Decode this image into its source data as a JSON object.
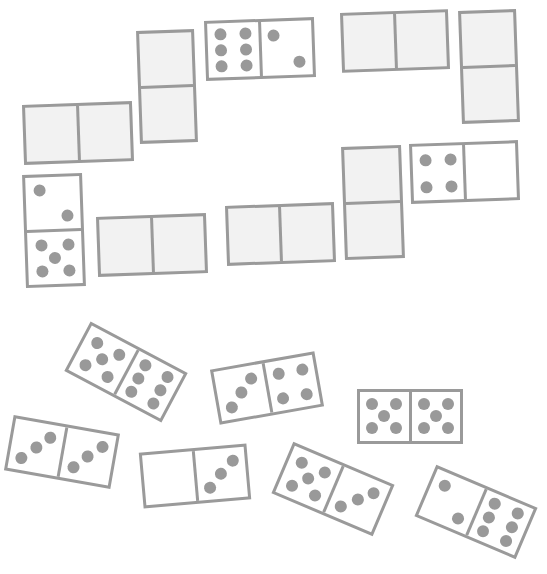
{
  "game": {
    "title": "Dominoes",
    "colors": {
      "background": "#ffffff",
      "border": "#9a9a9a",
      "placed_fill": "#f2f2f2",
      "tile_fill": "#ffffff",
      "pip": "#999999"
    }
  },
  "board": {
    "placed": [
      {
        "id": "p1",
        "orient": "h",
        "x": 23,
        "y": 103,
        "w": 110,
        "h": 60,
        "rot": -2,
        "blank": true,
        "a": null,
        "b": null
      },
      {
        "id": "p2",
        "orient": "v",
        "x": 138,
        "y": 30,
        "w": 58,
        "h": 113,
        "rot": -2,
        "blank": true,
        "a": null,
        "b": null
      },
      {
        "id": "p3",
        "orient": "h",
        "x": 205,
        "y": 19,
        "w": 110,
        "h": 60,
        "rot": -2,
        "blank": false,
        "a": 6,
        "b": 2
      },
      {
        "id": "p4",
        "orient": "h",
        "x": 341,
        "y": 11,
        "w": 108,
        "h": 60,
        "rot": -2,
        "blank": true,
        "a": null,
        "b": null
      },
      {
        "id": "p5",
        "orient": "v",
        "x": 460,
        "y": 10,
        "w": 58,
        "h": 113,
        "rot": -2,
        "blank": true,
        "a": null,
        "b": null
      },
      {
        "id": "p6",
        "orient": "v",
        "x": 24,
        "y": 174,
        "w": 60,
        "h": 113,
        "rot": -2,
        "blank": false,
        "a": 2,
        "b": 5
      },
      {
        "id": "p7",
        "orient": "h",
        "x": 97,
        "y": 215,
        "w": 110,
        "h": 60,
        "rot": -2,
        "blank": true,
        "a": null,
        "b": null
      },
      {
        "id": "p8",
        "orient": "h",
        "x": 226,
        "y": 204,
        "w": 109,
        "h": 60,
        "rot": -2,
        "blank": true,
        "a": null,
        "b": null
      },
      {
        "id": "p9",
        "orient": "v",
        "x": 343,
        "y": 146,
        "w": 60,
        "h": 113,
        "rot": -2,
        "blank": true,
        "a": null,
        "b": null
      },
      {
        "id": "p10",
        "orient": "h",
        "x": 410,
        "y": 142,
        "w": 109,
        "h": 60,
        "rot": -2,
        "blank": false,
        "a": 4,
        "b": 0
      }
    ],
    "hand": [
      {
        "id": "h1",
        "orient": "h",
        "cx": 126,
        "cy": 372,
        "w": 110,
        "h": 56,
        "rot": 28,
        "a": 5,
        "b": 6
      },
      {
        "id": "h2",
        "orient": "h",
        "cx": 267,
        "cy": 388,
        "w": 106,
        "h": 56,
        "rot": -10,
        "a": 3,
        "b": 4
      },
      {
        "id": "h3",
        "orient": "h",
        "cx": 410,
        "cy": 416,
        "w": 106,
        "h": 55,
        "rot": 0,
        "a": 5,
        "b": 5
      },
      {
        "id": "h4",
        "orient": "h",
        "cx": 62,
        "cy": 452,
        "w": 108,
        "h": 56,
        "rot": 10,
        "a": 3,
        "b": 3
      },
      {
        "id": "h5",
        "orient": "h",
        "cx": 195,
        "cy": 476,
        "w": 108,
        "h": 56,
        "rot": -5,
        "a": 0,
        "b": 3
      },
      {
        "id": "h6",
        "orient": "h",
        "cx": 333,
        "cy": 489,
        "w": 110,
        "h": 56,
        "rot": 23,
        "a": 5,
        "b": 3
      },
      {
        "id": "h7",
        "orient": "h",
        "cx": 476,
        "cy": 512,
        "w": 110,
        "h": 56,
        "rot": 23,
        "a": 2,
        "b": 6
      }
    ]
  }
}
